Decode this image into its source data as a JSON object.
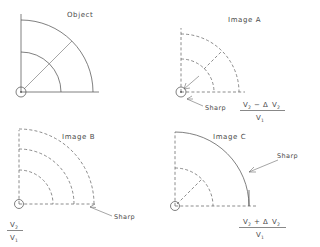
{
  "figure": {
    "background_color": "#ffffff",
    "line_color": "#555555",
    "text_color": "#4a4a4a",
    "width": 320,
    "height": 247
  },
  "panels": [
    {
      "id": "object",
      "title": "Object",
      "quadrant": "top-left",
      "arc_style": "solid",
      "has_sharp_label": false,
      "has_formula": false,
      "origin": {
        "x": 21,
        "y": 92
      },
      "arcs": [
        {
          "radius": 72,
          "style": "solid"
        },
        {
          "radius": 40,
          "style": "solid"
        }
      ],
      "radial_line_angle_deg": 45,
      "radial_line_from": 40,
      "radial_line_to": 72,
      "axes": {
        "x_length": 78,
        "y_length": 78
      }
    },
    {
      "id": "image-a",
      "title": "Image A",
      "quadrant": "top-right",
      "arc_style": "dashed",
      "has_sharp_label": true,
      "sharp_label": "Sharp",
      "has_formula": true,
      "origin": {
        "x": 181,
        "y": 92
      },
      "arcs": [
        {
          "radius": 58,
          "style": "dashed"
        },
        {
          "radius": 33,
          "style": "dashed"
        }
      ],
      "radial_line_angle_deg": 45,
      "radial_line_from": 33,
      "radial_line_to": 58,
      "axes": {
        "x_length": 64,
        "y_length": 64
      },
      "formula": {
        "numerator_parts": [
          "V",
          "2",
          " − Δ V",
          "2"
        ],
        "numerator_display": "V₂ − Δ V₂",
        "denominator_display": "V₁",
        "numerator_base_1": "V",
        "numerator_sub_1": "2",
        "numerator_operator": "−",
        "numerator_delta": "Δ",
        "numerator_base_2": "V",
        "numerator_sub_2": "2",
        "denominator_base": "V",
        "denominator_sub": "1"
      }
    },
    {
      "id": "image-b",
      "title": "Image B",
      "quadrant": "bottom-left",
      "arc_style": "dashed",
      "has_sharp_label": true,
      "sharp_label": "Sharp",
      "has_formula": true,
      "origin": {
        "x": 19,
        "y": 204
      },
      "arcs": [
        {
          "radius": 78,
          "style": "dashed"
        },
        {
          "radius": 58,
          "style": "dashed"
        },
        {
          "radius": 36,
          "style": "dashed"
        }
      ],
      "radial_line_angle_deg": null,
      "axes": {
        "x_length": 84,
        "y_length": 84
      },
      "formula": {
        "numerator_display": "V₂",
        "denominator_display": "V₁",
        "numerator_base": "V",
        "numerator_sub": "2",
        "denominator_base": "V",
        "denominator_sub": "1"
      }
    },
    {
      "id": "image-c",
      "title": "Image C",
      "quadrant": "bottom-right",
      "arc_style": "mixed",
      "has_sharp_label": true,
      "sharp_label": "Sharp",
      "has_formula": true,
      "origin": {
        "x": 175,
        "y": 206
      },
      "arcs": [
        {
          "radius": 76,
          "style": "solid"
        },
        {
          "radius": 40,
          "style": "dashed"
        }
      ],
      "radial_line_angle_deg": 45,
      "radial_line_from": 0,
      "radial_line_to": 40,
      "axes": {
        "x_length": 82,
        "y_length": 82
      },
      "formula": {
        "numerator_display": "V₂ + Δ V₂",
        "denominator_display": "V₁",
        "numerator_base_1": "V",
        "numerator_sub_1": "2",
        "numerator_operator": "+",
        "numerator_delta": "Δ",
        "numerator_base_2": "V",
        "numerator_sub_2": "2",
        "denominator_base": "V",
        "denominator_sub": "1"
      }
    }
  ],
  "labels": {
    "object_title": "Object",
    "image_a_title": "Image A",
    "image_b_title": "Image B",
    "image_c_title": "Image C",
    "sharp_a": "Sharp",
    "sharp_b": "Sharp",
    "sharp_c": "Sharp",
    "v_letter": "V",
    "sub_one": "1",
    "sub_two": "2",
    "minus": "−",
    "plus": "+",
    "delta": "Δ"
  }
}
